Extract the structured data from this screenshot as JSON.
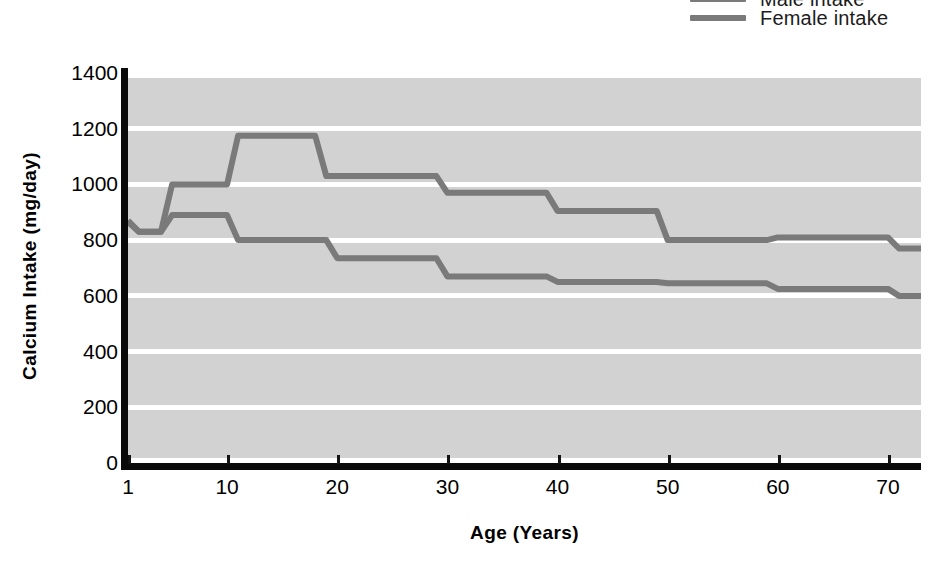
{
  "chart_data": {
    "type": "line",
    "title": "",
    "xlabel": "Age (Years)",
    "ylabel": "Calcium Intake (mg/day)",
    "xlim": [
      1,
      73
    ],
    "ylim": [
      0,
      1400
    ],
    "xticks": [
      1,
      10,
      20,
      30,
      40,
      50,
      60,
      70
    ],
    "xticklabels": [
      "1",
      "10",
      "20",
      "30",
      "40",
      "50",
      "60",
      "70"
    ],
    "yticks": [
      0,
      200,
      400,
      600,
      800,
      1000,
      1200,
      1400
    ],
    "yticklabels": [
      "0",
      "200",
      "400",
      "600",
      "800",
      "1000",
      "1200",
      "1400"
    ],
    "grid": "horizontal-white",
    "legend_position": "top-right",
    "plot_background": "#d2d2d2",
    "series": [
      {
        "name": "Male intake",
        "color": "#7a7a7a",
        "step": "post",
        "x": [
          1,
          2,
          4,
          5,
          10,
          11,
          18,
          19,
          21,
          29,
          30,
          39,
          40,
          49,
          50,
          59,
          60,
          70,
          71,
          73
        ],
        "values": [
          870,
          830,
          830,
          1000,
          1000,
          1175,
          1175,
          1030,
          1030,
          1030,
          970,
          970,
          905,
          905,
          800,
          800,
          810,
          810,
          770,
          770
        ]
      },
      {
        "name": "Female intake",
        "color": "#7a7a7a",
        "step": "post",
        "x": [
          1,
          2,
          4,
          5,
          10,
          11,
          19,
          20,
          29,
          30,
          39,
          40,
          49,
          50,
          59,
          60,
          70,
          71,
          73
        ],
        "values": [
          865,
          830,
          830,
          890,
          890,
          800,
          800,
          735,
          735,
          670,
          670,
          650,
          650,
          645,
          645,
          625,
          625,
          600,
          600
        ]
      }
    ]
  },
  "legend": {
    "entries": [
      {
        "label": "Male intake",
        "color": "#7a7a7a"
      },
      {
        "label": "Female intake",
        "color": "#7a7a7a"
      }
    ]
  },
  "axes": {
    "y_title": "Calcium Intake (mg/day)",
    "x_title": "Age (Years)"
  }
}
